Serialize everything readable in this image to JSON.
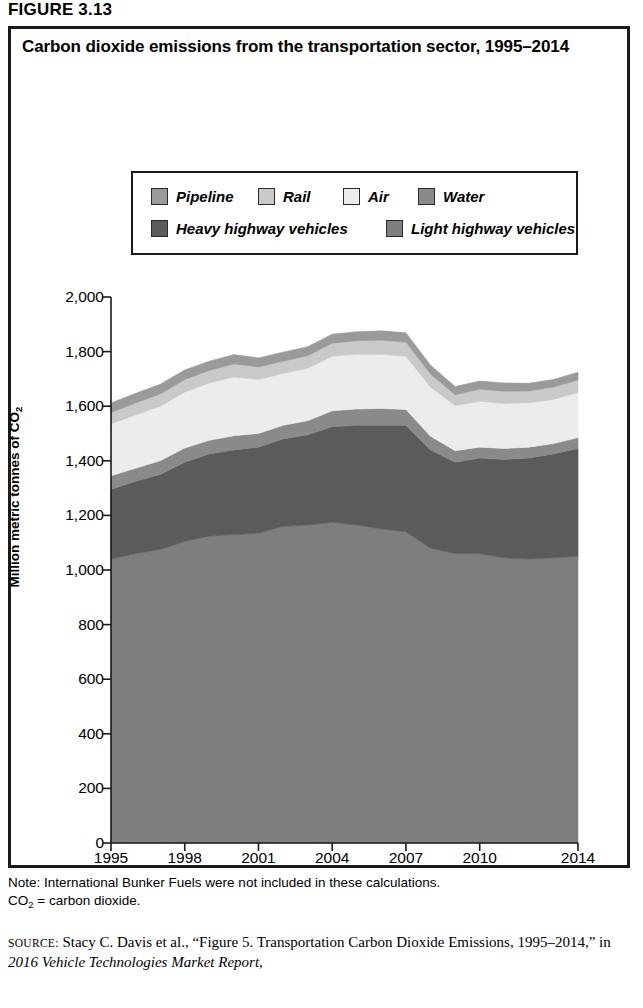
{
  "figure": {
    "label": "FIGURE 3.13"
  },
  "chart_title": "Carbon dioxide emissions from the transportation sector, 1995–2014",
  "legend": {
    "items": [
      {
        "label": "Pipeline",
        "color": "#9a9a9a"
      },
      {
        "label": "Rail",
        "color": "#c9c9c9"
      },
      {
        "label": "Air",
        "color": "#ececec"
      },
      {
        "label": "Water",
        "color": "#8a8a8a"
      },
      {
        "label": "Heavy highway vehicles",
        "color": "#5b5b5b"
      },
      {
        "label": "Light highway vehicles",
        "color": "#7e7e7e"
      }
    ]
  },
  "notes": {
    "line1": "Note: International Bunker Fuels were not included in these calculations.",
    "line2_pre": "CO",
    "line2_sub": "2",
    "line2_post": " = carbon dioxide."
  },
  "source": {
    "prefix": "SOURCE:",
    "text_a": " Stacy C. Davis et al., “Figure 5. Transportation Carbon Dioxide Emissions, 1995–2014,” in ",
    "italic": "2016 Vehicle Technologies Market Report,"
  },
  "chart_data": {
    "type": "area",
    "title": "Carbon dioxide emissions from the transportation sector, 1995–2014",
    "xlabel": "",
    "ylabel": "Million metric tonnes of CO2",
    "ylim": [
      0,
      2000
    ],
    "ytick_values": [
      0,
      200,
      400,
      600,
      800,
      1000,
      1200,
      1400,
      1600,
      1800,
      2000
    ],
    "ytick_labels": [
      "0",
      "200",
      "400",
      "600",
      "800",
      "1,000",
      "1,200",
      "1,400",
      "1,600",
      "1,800",
      "2,000"
    ],
    "xlim": [
      1995,
      2014
    ],
    "xtick_values": [
      1995,
      1998,
      2001,
      2004,
      2007,
      2010,
      2014
    ],
    "xtick_labels": [
      "1995",
      "1998",
      "2001",
      "2004",
      "2007",
      "2010",
      "2014"
    ],
    "x": [
      1995,
      1996,
      1997,
      1998,
      1999,
      2000,
      2001,
      2002,
      2003,
      2004,
      2005,
      2006,
      2007,
      2008,
      2009,
      2010,
      2011,
      2012,
      2013,
      2014
    ],
    "grid": false,
    "legend_position": "upper-center",
    "stack_order_bottom_to_top": [
      "Light highway vehicles",
      "Heavy highway vehicles",
      "Water",
      "Air",
      "Rail",
      "Pipeline"
    ],
    "series": [
      {
        "name": "Light highway vehicles",
        "color": "#7e7e7e",
        "values": [
          1040,
          1060,
          1075,
          1105,
          1125,
          1130,
          1135,
          1160,
          1165,
          1175,
          1165,
          1150,
          1140,
          1080,
          1060,
          1060,
          1045,
          1040,
          1045,
          1050
        ]
      },
      {
        "name": "Heavy highway vehicles",
        "color": "#5b5b5b",
        "values": [
          255,
          265,
          275,
          290,
          300,
          310,
          315,
          320,
          330,
          350,
          365,
          380,
          390,
          360,
          335,
          350,
          360,
          370,
          380,
          395
        ]
      },
      {
        "name": "Water",
        "color": "#8a8a8a",
        "values": [
          50,
          48,
          50,
          52,
          50,
          52,
          50,
          50,
          52,
          58,
          60,
          62,
          58,
          50,
          42,
          40,
          40,
          40,
          38,
          40
        ]
      },
      {
        "name": "Air",
        "color": "#ececec",
        "values": [
          190,
          195,
          200,
          205,
          210,
          215,
          198,
          190,
          192,
          200,
          200,
          198,
          195,
          180,
          165,
          168,
          165,
          163,
          162,
          165
        ]
      },
      {
        "name": "Rail",
        "color": "#c9c9c9",
        "values": [
          42,
          44,
          45,
          46,
          46,
          48,
          46,
          45,
          46,
          48,
          50,
          52,
          52,
          48,
          40,
          44,
          45,
          43,
          45,
          46
        ]
      },
      {
        "name": "Pipeline",
        "color": "#9a9a9a",
        "values": [
          35,
          35,
          35,
          35,
          34,
          34,
          33,
          33,
          33,
          33,
          33,
          34,
          34,
          32,
          30,
          30,
          30,
          28,
          28,
          28
        ]
      }
    ],
    "totals": [
      1612,
      1647,
      1680,
      1733,
      1765,
      1789,
      1777,
      1798,
      1818,
      1864,
      1873,
      1876,
      1869,
      1750,
      1672,
      1692,
      1685,
      1684,
      1698,
      1724
    ]
  }
}
